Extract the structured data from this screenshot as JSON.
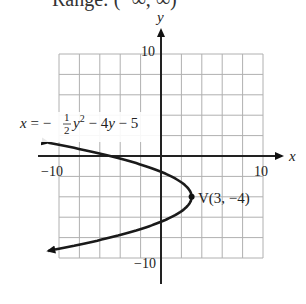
{
  "header": {
    "cut_off_text": "Range: (−∞, ∞)"
  },
  "graph": {
    "equation": {
      "lhs": "x = −",
      "frac_num": "1",
      "frac_den": "2",
      "y2": "y",
      "exp": "2",
      "rest": " − 4y − 5"
    },
    "axis_labels": {
      "x": "x",
      "y": "y"
    },
    "tick_labels": {
      "x_min": "−10",
      "x_max": "10",
      "y_min": "−10",
      "y_max": "10"
    },
    "vertex_label": "V(3, −4)",
    "colors": {
      "grid": "#b0b0b0",
      "axis": "#222222",
      "curve": "#1a1a1a"
    }
  },
  "chart_data": {
    "type": "line",
    "xlabel": "x",
    "ylabel": "y",
    "xlim": [
      -10,
      10
    ],
    "ylim": [
      -10,
      10
    ],
    "grid": true,
    "grid_step": 2,
    "series": [
      {
        "name": "parabola x = −½y² − 4y − 5",
        "vertex": [
          3,
          -4
        ],
        "opens": "left",
        "x_intercept": -5
      }
    ],
    "annotations": [
      "V(3, −4)"
    ]
  }
}
